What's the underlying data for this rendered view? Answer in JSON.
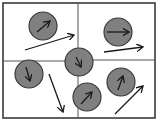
{
  "diagram": {
    "title": "",
    "colors": {
      "background": "#ffffff",
      "frame": "#3a3a3a",
      "divider": "#555555",
      "circle_fill": "#808080",
      "circle_stroke": "#3a3a3a",
      "arrow": "#1a1a1a"
    },
    "frame": {
      "x": 3,
      "y": 3,
      "width": 152,
      "height": 115
    },
    "dividers": {
      "vertical_x": 78,
      "horizontal_left_y": 61,
      "horizontal_right_y": 60
    },
    "particles": [
      {
        "id": "top-left",
        "cx": 43,
        "cy": 26,
        "r": 14,
        "inner_arrow": {
          "x1": 37,
          "y1": 32,
          "x2": 50,
          "y2": 21
        },
        "velocity_arrow": {
          "x1": 25,
          "y1": 50,
          "x2": 74,
          "y2": 35
        }
      },
      {
        "id": "top-right",
        "cx": 118,
        "cy": 32,
        "r": 14,
        "inner_arrow": {
          "x1": 107,
          "y1": 32,
          "x2": 129,
          "y2": 32
        },
        "velocity_arrow": {
          "x1": 104,
          "y1": 52,
          "x2": 143,
          "y2": 47
        }
      },
      {
        "id": "center",
        "cx": 79,
        "cy": 62,
        "r": 14,
        "inner_arrow": {
          "x1": 76,
          "y1": 57,
          "x2": 81,
          "y2": 67
        },
        "velocity_arrow": null
      },
      {
        "id": "bottom-left",
        "cx": 29,
        "cy": 74,
        "r": 14,
        "inner_arrow": {
          "x1": 26,
          "y1": 67,
          "x2": 30,
          "y2": 81
        },
        "velocity_arrow": {
          "x1": 49,
          "y1": 74,
          "x2": 63,
          "y2": 112
        }
      },
      {
        "id": "bottom-center",
        "cx": 87,
        "cy": 97,
        "r": 14,
        "inner_arrow": {
          "x1": 81,
          "y1": 104,
          "x2": 92,
          "y2": 92
        },
        "velocity_arrow": null
      },
      {
        "id": "bottom-right",
        "cx": 121,
        "cy": 82,
        "r": 14,
        "inner_arrow": {
          "x1": 118,
          "y1": 90,
          "x2": 123,
          "y2": 76
        },
        "velocity_arrow": {
          "x1": 115,
          "y1": 114,
          "x2": 143,
          "y2": 86
        }
      }
    ]
  }
}
